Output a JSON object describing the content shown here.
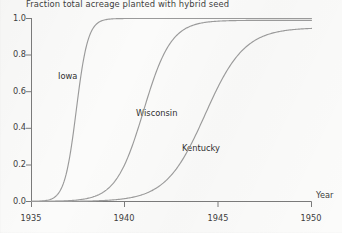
{
  "chart_data": {
    "type": "line",
    "title": "Fraction total acreage planted with hybrid seed",
    "xlabel": "Year",
    "ylabel": "",
    "xlim": [
      1935,
      1950
    ],
    "ylim": [
      0.0,
      1.0
    ],
    "grid": false,
    "legend_position": "inline-annotations",
    "xticks": [
      "1935",
      "1940",
      "1945",
      "1950"
    ],
    "xtick_values": [
      1935,
      1940,
      1945,
      1950
    ],
    "yticks": [
      "0.0",
      "0.2",
      "0.4",
      "0.6",
      "0.8",
      "1.0"
    ],
    "ytick_values": [
      0.0,
      0.2,
      0.4,
      0.6,
      0.8,
      1.0
    ],
    "x": [
      1935,
      1936,
      1937,
      1938,
      1939,
      1940,
      1941,
      1942,
      1943,
      1944,
      1945,
      1946,
      1947,
      1948,
      1949,
      1950
    ],
    "series": [
      {
        "name": "Iowa",
        "color": "#9a9a9a",
        "midpoint_year": 1937.4,
        "values": [
          0.05,
          0.18,
          0.42,
          0.72,
          0.89,
          0.95,
          0.97,
          0.98,
          0.99,
          0.99,
          1.0,
          1.0,
          1.0,
          1.0,
          1.0,
          1.0
        ]
      },
      {
        "name": "Wisconsin",
        "color": "#9a9a9a",
        "midpoint_year": 1941.0,
        "values": [
          0.02,
          0.04,
          0.07,
          0.13,
          0.24,
          0.39,
          0.56,
          0.71,
          0.82,
          0.89,
          0.93,
          0.96,
          0.97,
          0.98,
          0.99,
          0.99
        ]
      },
      {
        "name": "Kentucky",
        "color": "#9a9a9a",
        "midpoint_year": 1944.3,
        "values": [
          0.01,
          0.02,
          0.03,
          0.05,
          0.08,
          0.13,
          0.19,
          0.28,
          0.39,
          0.5,
          0.62,
          0.73,
          0.82,
          0.88,
          0.92,
          0.95
        ]
      }
    ],
    "annotations": [
      {
        "text": "Iowa",
        "x_px": 58,
        "y_px": 71
      },
      {
        "text": "Wisconsin",
        "x_px": 136,
        "y_px": 108
      },
      {
        "text": "Kentucky",
        "x_px": 182,
        "y_px": 143
      }
    ]
  },
  "axis": {
    "x_name": "Year",
    "y_name": ""
  },
  "footer": {
    "scrap_text": ""
  },
  "colors": {
    "curve": "#9a9a9a",
    "axis": "#6b6b6b",
    "text": "#3d3d3d",
    "background": "#fbfbfa"
  }
}
